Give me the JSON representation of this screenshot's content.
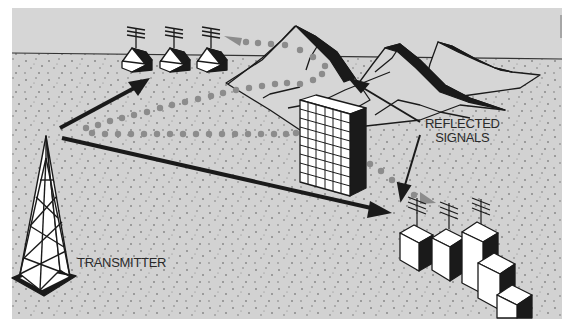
{
  "diagram": {
    "type": "illustration",
    "labels": {
      "transmitter": "TRANSMITTER",
      "reflected_line1": "REFLECTED",
      "reflected_line2": "SIGNALS"
    },
    "elements": [
      {
        "id": "transmitter-tower",
        "label": "TRANSMITTER"
      },
      {
        "id": "houses-group",
        "count": 3,
        "antennas": 3
      },
      {
        "id": "mountains",
        "count": 3
      },
      {
        "id": "office-building"
      },
      {
        "id": "city-buildings",
        "count": 5,
        "antennas": 3
      },
      {
        "id": "direct-signal-arrows",
        "count": 2
      },
      {
        "id": "reflected-signal-paths",
        "count": 2,
        "style": "dotted"
      }
    ],
    "colors": {
      "sky": "#d6d6d6",
      "ground": "#d2d2d2",
      "ink": "#1a1a1a",
      "dots": "#8c8c8c",
      "white": "#ffffff",
      "margin": "#ffffff"
    }
  }
}
